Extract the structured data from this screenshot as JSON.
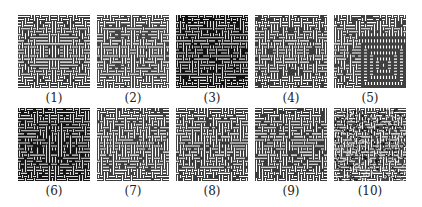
{
  "figure": {
    "panels": [
      {
        "label": "(1)",
        "style": "sym4",
        "seed": 11,
        "fg": "#ffffff",
        "bg": "#3a3a3a",
        "noise": 0.0
      },
      {
        "label": "(2)",
        "style": "sym4",
        "seed": 23,
        "fg": "#ffffff",
        "bg": "#444444",
        "noise": 0.08
      },
      {
        "label": "(3)",
        "style": "sym4",
        "seed": 37,
        "fg": "#dddddd",
        "bg": "#111111",
        "noise": 0.25
      },
      {
        "label": "(4)",
        "style": "sym4",
        "seed": 41,
        "fg": "#ffffff",
        "bg": "#3c3c3c",
        "noise": 0.12
      },
      {
        "label": "(5)",
        "style": "corner",
        "seed": 53,
        "fg": "#ffffff",
        "bg": "#404040",
        "noise": 0.0
      },
      {
        "label": "(6)",
        "style": "sym4",
        "seed": 67,
        "fg": "#dddddd",
        "bg": "#151515",
        "noise": 0.3
      },
      {
        "label": "(7)",
        "style": "random",
        "seed": 71,
        "fg": "#ffffff",
        "bg": "#3f3f3f",
        "noise": 0.18
      },
      {
        "label": "(8)",
        "style": "random",
        "seed": 83,
        "fg": "#ffffff",
        "bg": "#3a3a3a",
        "noise": 0.15
      },
      {
        "label": "(9)",
        "style": "random",
        "seed": 97,
        "fg": "#ffffff",
        "bg": "#3a3a3a",
        "noise": 0.2
      },
      {
        "label": "(10)",
        "style": "noise",
        "seed": 101,
        "fg": "#ffffff",
        "bg": "#444444",
        "noise": 0.55
      }
    ]
  }
}
